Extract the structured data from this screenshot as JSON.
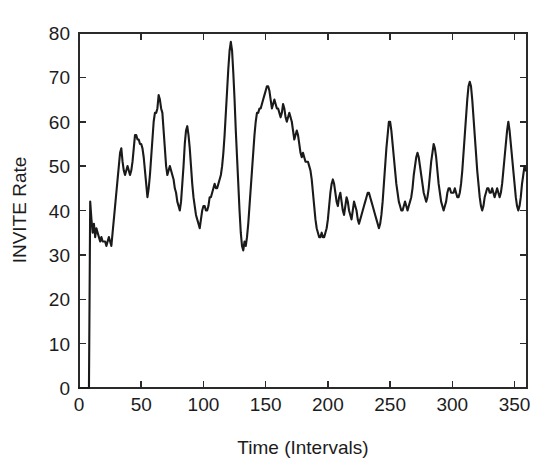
{
  "chart_data": {
    "type": "line",
    "title": "",
    "xlabel": "Time (Intervals)",
    "ylabel": "INVITE Rate",
    "xlim": [
      0,
      360
    ],
    "ylim": [
      0,
      80
    ],
    "xticks": [
      0,
      50,
      100,
      150,
      200,
      250,
      300,
      350
    ],
    "xticklabels": [
      "0",
      "50",
      "100",
      "150",
      "200",
      "250",
      "300",
      "350"
    ],
    "yticks": [
      0,
      10,
      20,
      30,
      40,
      50,
      60,
      70,
      80
    ],
    "yticklabels": [
      "0",
      "10",
      "20",
      "30",
      "40",
      "50",
      "60",
      "70",
      "80"
    ],
    "grid": false,
    "legend": null,
    "line_color": "#1a1a1a",
    "series": [
      {
        "name": "INVITE Rate",
        "x": [
          0,
          1,
          2,
          3,
          4,
          5,
          6,
          7,
          8,
          9,
          10,
          11,
          12,
          13,
          14,
          15,
          16,
          17,
          18,
          19,
          20,
          21,
          22,
          23,
          24,
          25,
          26,
          27,
          28,
          29,
          30,
          31,
          32,
          33,
          34,
          35,
          36,
          37,
          38,
          39,
          40,
          41,
          42,
          43,
          44,
          45,
          46,
          47,
          48,
          49,
          50,
          51,
          52,
          53,
          54,
          55,
          56,
          57,
          58,
          59,
          60,
          61,
          62,
          63,
          64,
          65,
          66,
          67,
          68,
          69,
          70,
          71,
          72,
          73,
          74,
          75,
          76,
          77,
          78,
          79,
          80,
          81,
          82,
          83,
          84,
          85,
          86,
          87,
          88,
          89,
          90,
          91,
          92,
          93,
          94,
          95,
          96,
          97,
          98,
          99,
          100,
          101,
          102,
          103,
          104,
          105,
          106,
          107,
          108,
          109,
          110,
          111,
          112,
          113,
          114,
          115,
          116,
          117,
          118,
          119,
          120,
          121,
          122,
          123,
          124,
          125,
          126,
          127,
          128,
          129,
          130,
          131,
          132,
          133,
          134,
          135,
          136,
          137,
          138,
          139,
          140,
          141,
          142,
          143,
          144,
          145,
          146,
          147,
          148,
          149,
          150,
          151,
          152,
          153,
          154,
          155,
          156,
          157,
          158,
          159,
          160,
          161,
          162,
          163,
          164,
          165,
          166,
          167,
          168,
          169,
          170,
          171,
          172,
          173,
          174,
          175,
          176,
          177,
          178,
          179,
          180,
          181,
          182,
          183,
          184,
          185,
          186,
          187,
          188,
          189,
          190,
          191,
          192,
          193,
          194,
          195,
          196,
          197,
          198,
          199,
          200,
          201,
          202,
          203,
          204,
          205,
          206,
          207,
          208,
          209,
          210,
          211,
          212,
          213,
          214,
          215,
          216,
          217,
          218,
          219,
          220,
          221,
          222,
          223,
          224,
          225,
          226,
          227,
          228,
          229,
          230,
          231,
          232,
          233,
          234,
          235,
          236,
          237,
          238,
          239,
          240,
          241,
          242,
          243,
          244,
          245,
          246,
          247,
          248,
          249,
          250,
          251,
          252,
          253,
          254,
          255,
          256,
          257,
          258,
          259,
          260,
          261,
          262,
          263,
          264,
          265,
          266,
          267,
          268,
          269,
          270,
          271,
          272,
          273,
          274,
          275,
          276,
          277,
          278,
          279,
          280,
          281,
          282,
          283,
          284,
          285,
          286,
          287,
          288,
          289,
          290,
          291,
          292,
          293,
          294,
          295,
          296,
          297,
          298,
          299,
          300,
          301,
          302,
          303,
          304,
          305,
          306,
          307,
          308,
          309,
          310,
          311,
          312,
          313,
          314,
          315,
          316,
          317,
          318,
          319,
          320,
          321,
          322,
          323,
          324,
          325,
          326,
          327,
          328,
          329,
          330,
          331,
          332,
          333,
          334,
          335,
          336,
          337,
          338,
          339,
          340,
          341,
          342,
          343,
          344,
          345,
          346,
          347,
          348,
          349,
          350,
          351,
          352,
          353,
          354,
          355,
          356,
          357,
          358,
          359
        ],
        "values": [
          0,
          0,
          0,
          0,
          0,
          0,
          0,
          0,
          0,
          42,
          38,
          35,
          37,
          34,
          36,
          35,
          34,
          33,
          34,
          33,
          33,
          33,
          32,
          33,
          34,
          33,
          32,
          35,
          38,
          41,
          44,
          47,
          50,
          53,
          54,
          51,
          49,
          48,
          49,
          50,
          49,
          48,
          49,
          51,
          54,
          57,
          57,
          56,
          56,
          55,
          55,
          54,
          52,
          49,
          46,
          43,
          45,
          48,
          52,
          56,
          60,
          62,
          62,
          63,
          66,
          65,
          63,
          62,
          58,
          54,
          50,
          48,
          49,
          50,
          49,
          48,
          47,
          45,
          44,
          42,
          41,
          40,
          42,
          46,
          50,
          55,
          58,
          59,
          57,
          54,
          50,
          46,
          43,
          41,
          39,
          38,
          37,
          36,
          38,
          40,
          41,
          41,
          40,
          40,
          41,
          43,
          43,
          44,
          45,
          46,
          45,
          45,
          46,
          47,
          48,
          50,
          53,
          57,
          62,
          67,
          72,
          76,
          78,
          76,
          71,
          65,
          58,
          52,
          46,
          40,
          35,
          32,
          31,
          33,
          32,
          34,
          37,
          41,
          45,
          49,
          53,
          57,
          60,
          62,
          62,
          63,
          63,
          64,
          65,
          66,
          67,
          68,
          68,
          67,
          65,
          63,
          64,
          65,
          64,
          63,
          63,
          62,
          61,
          62,
          64,
          63,
          61,
          60,
          61,
          62,
          61,
          60,
          58,
          56,
          57,
          58,
          57,
          55,
          53,
          52,
          53,
          52,
          51,
          51,
          51,
          50,
          49,
          47,
          44,
          41,
          38,
          36,
          35,
          34,
          34,
          35,
          34,
          34,
          35,
          36,
          38,
          41,
          44,
          46,
          47,
          46,
          44,
          42,
          41,
          43,
          44,
          42,
          40,
          39,
          41,
          43,
          42,
          40,
          39,
          38,
          40,
          42,
          41,
          40,
          38,
          37,
          38,
          39,
          40,
          41,
          42,
          43,
          44,
          44,
          43,
          42,
          41,
          40,
          39,
          38,
          37,
          36,
          37,
          39,
          42,
          46,
          50,
          54,
          57,
          60,
          60,
          58,
          55,
          52,
          49,
          46,
          44,
          42,
          41,
          40,
          40,
          41,
          42,
          41,
          40,
          41,
          42,
          43,
          45,
          48,
          50,
          52,
          53,
          52,
          50,
          48,
          46,
          44,
          43,
          42,
          43,
          45,
          48,
          51,
          53,
          55,
          54,
          52,
          49,
          46,
          44,
          42,
          41,
          40,
          41,
          42,
          44,
          45,
          45,
          44,
          44,
          44,
          45,
          44,
          43,
          43,
          44,
          46,
          49,
          53,
          57,
          61,
          65,
          68,
          69,
          68,
          65,
          61,
          57,
          53,
          49,
          46,
          43,
          41,
          40,
          41,
          43,
          44,
          45,
          45,
          44,
          44,
          45,
          44,
          43,
          44,
          45,
          44,
          43,
          44,
          46,
          49,
          52,
          55,
          58,
          60,
          58,
          55,
          52,
          49,
          46,
          43,
          41,
          40,
          41,
          43,
          46,
          48,
          50,
          49
        ]
      }
    ]
  },
  "axes": {
    "y_label": "INVITE Rate",
    "x_label": "Time (Intervals)"
  }
}
